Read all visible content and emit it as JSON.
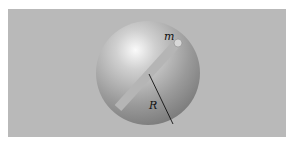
{
  "figure": {
    "labels": {
      "mass": "m",
      "radius": "R"
    },
    "elements": [
      "sphere",
      "tunnel",
      "particle",
      "radius-line"
    ],
    "colors": {
      "background": "#ffffff",
      "panel": "#b9b9b9",
      "sphere_highlight": "#fafafa",
      "sphere_shadow": "#7c7c7c",
      "tunnel": "#b5b5b5"
    }
  }
}
